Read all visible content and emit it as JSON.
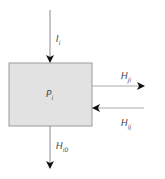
{
  "diagram": {
    "process": {
      "label": "P",
      "sub": "i"
    },
    "flows": [
      {
        "id": "input",
        "label": "I",
        "sub": "i",
        "direction": "down-into-box"
      },
      {
        "id": "out-right",
        "label": "H",
        "sub": "ji",
        "direction": "right-out-of-box"
      },
      {
        "id": "in-right",
        "label": "H",
        "sub": "ij",
        "direction": "left-into-box"
      },
      {
        "id": "out-bottom",
        "label": "H",
        "sub": "i0",
        "direction": "down-out-of-box"
      }
    ]
  },
  "colors": {
    "box_fill": "#e2e2e2",
    "box_stroke": "#9a9a9a",
    "line": "#8a8a8a",
    "arrowhead": "#111111"
  }
}
